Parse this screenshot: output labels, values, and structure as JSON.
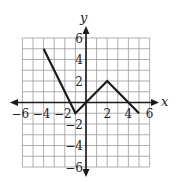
{
  "chart_data": {
    "type": "line",
    "title": "",
    "xlabel": "x",
    "ylabel": "y",
    "xlim": [
      -6,
      6
    ],
    "ylim": [
      -6,
      6
    ],
    "grid": true,
    "grid_step": 1,
    "x_ticks": [
      -6,
      -4,
      -2,
      2,
      4,
      6
    ],
    "y_ticks": [
      6,
      4,
      2,
      -2,
      -4,
      -6
    ],
    "x_tick_labels": [
      "−6",
      "−4",
      "−2",
      "2",
      "4",
      "6"
    ],
    "y_tick_labels": [
      "6",
      "4",
      "2",
      "−2",
      "−4",
      "−6"
    ],
    "series": [
      {
        "name": "piecewise linear function",
        "points": [
          [
            -4,
            5
          ],
          [
            -1,
            -1
          ],
          [
            0,
            0
          ],
          [
            2,
            2
          ],
          [
            5,
            -1
          ]
        ]
      }
    ],
    "legend": "none"
  },
  "colors": {
    "grid": "#9a9a9a",
    "axis": "#1a1a1a",
    "line": "#1a1a1a"
  },
  "labels": {
    "x_axis": "x",
    "y_axis": "y"
  }
}
